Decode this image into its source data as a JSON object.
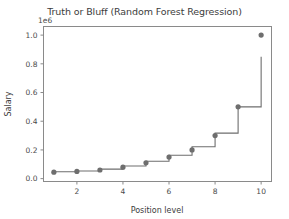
{
  "chart_data": {
    "type": "line",
    "title": "Truth or Bluff (Random Forest Regression)",
    "xlabel": "Position level",
    "ylabel": "Salary",
    "y_exponent_label": "1e6",
    "xlim": [
      0.55,
      10.45
    ],
    "ylim": [
      -0.02,
      1.06
    ],
    "xticks": [
      2,
      4,
      6,
      8,
      10
    ],
    "xtick_labels": [
      "2",
      "4",
      "6",
      "8",
      "10"
    ],
    "yticks": [
      0.0,
      0.2,
      0.4,
      0.6,
      0.8,
      1.0
    ],
    "ytick_labels": [
      "0.0",
      "0.2",
      "0.4",
      "0.6",
      "0.8",
      "1.0"
    ],
    "grid": false,
    "legend": null,
    "series": [
      {
        "name": "Actual salaries",
        "type": "scatter",
        "color": "#6e6e6e",
        "marker": "o",
        "x": [
          1,
          2,
          3,
          4,
          5,
          6,
          7,
          8,
          9,
          10
        ],
        "values": [
          0.045,
          0.05,
          0.06,
          0.08,
          0.11,
          0.15,
          0.2,
          0.3,
          0.5,
          1.0
        ]
      },
      {
        "name": "Random Forest prediction",
        "type": "step",
        "color": "#6e6e6e",
        "x": [
          1,
          1.5,
          2,
          2.5,
          3,
          3.5,
          4,
          4.5,
          5,
          5.5,
          6,
          6.5,
          7,
          7.5,
          8,
          8.5,
          9,
          9.5,
          10
        ],
        "values": [
          0.0475,
          0.0475,
          0.053,
          0.053,
          0.066,
          0.066,
          0.0885,
          0.0885,
          0.121,
          0.121,
          0.163,
          0.163,
          0.222,
          0.222,
          0.317,
          0.317,
          0.5,
          0.5,
          0.85
        ]
      }
    ]
  },
  "figure": {
    "axes_color": "#8a8a8a",
    "text_color": "#3c3c3c",
    "background": "#ffffff"
  }
}
